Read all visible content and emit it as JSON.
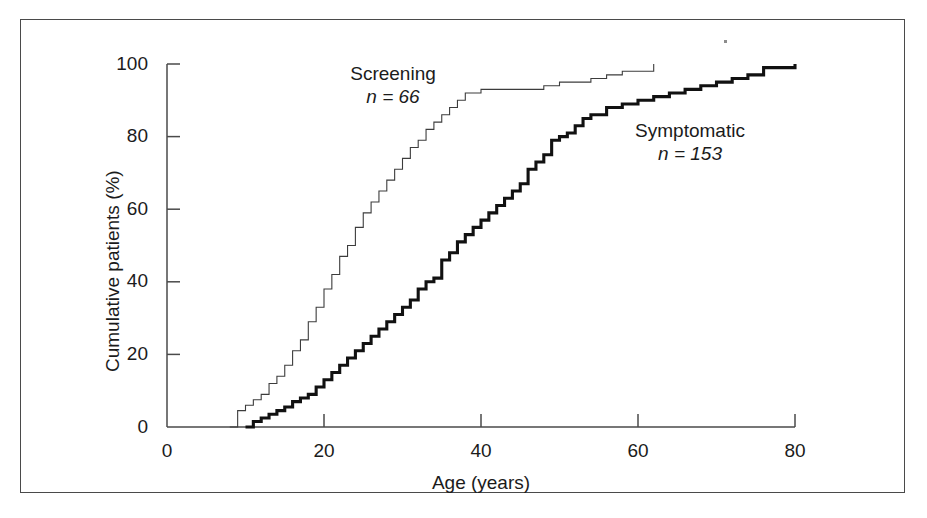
{
  "figure": {
    "background_color": "#ffffff",
    "frame_color": "#4a4a4a",
    "text_color": "#1b1b1b"
  },
  "chart_data": {
    "type": "line",
    "title": "",
    "subtitle": "",
    "xlabel": "Age (years)",
    "ylabel": "Cumulative patients (%)",
    "xlim": [
      0,
      80
    ],
    "ylim": [
      0,
      100
    ],
    "xticks": [
      0,
      20,
      40,
      60,
      80
    ],
    "yticks": [
      0,
      20,
      40,
      60,
      80,
      100
    ],
    "xtick_labels": [
      "0",
      "20",
      "40",
      "60",
      "80"
    ],
    "ytick_labels": [
      "0",
      "20",
      "40",
      "60",
      "80",
      "100"
    ],
    "grid": false,
    "legend_position": "inline-annotation",
    "step_style": "post",
    "series": [
      {
        "name": "Screening",
        "annotation_label": "Screening",
        "annotation_n": "n = 66",
        "n": 66,
        "line_color": "#3c3c3c",
        "line_width": 1.1,
        "x": [
          8,
          9,
          10,
          11,
          12,
          13,
          14,
          15,
          16,
          17,
          18,
          19,
          20,
          21,
          22,
          23,
          24,
          25,
          26,
          27,
          28,
          29,
          30,
          31,
          32,
          33,
          34,
          35,
          36,
          37,
          38,
          40,
          43,
          46,
          48,
          50,
          52,
          54,
          56,
          58,
          62
        ],
        "y": [
          0,
          4.5,
          6,
          7.5,
          9,
          12,
          14,
          17,
          21,
          24,
          29,
          33,
          38,
          42,
          47,
          50,
          55,
          59,
          62,
          65,
          68,
          71,
          74,
          77,
          79,
          82,
          84,
          86,
          88,
          90,
          92,
          93,
          93,
          93,
          94,
          95,
          95,
          96,
          97,
          98,
          100
        ]
      },
      {
        "name": "Symptomatic",
        "annotation_label": "Symptomatic",
        "annotation_n": "n = 153",
        "n": 153,
        "line_color": "#111111",
        "line_width": 3.1,
        "x": [
          10,
          11,
          12,
          13,
          14,
          15,
          16,
          17,
          18,
          19,
          20,
          21,
          22,
          23,
          24,
          25,
          26,
          27,
          28,
          29,
          30,
          31,
          32,
          33,
          34,
          35,
          36,
          37,
          38,
          39,
          40,
          41,
          42,
          43,
          44,
          45,
          46,
          47,
          48,
          49,
          50,
          51,
          52,
          53,
          54,
          56,
          58,
          60,
          62,
          64,
          66,
          68,
          70,
          72,
          74,
          76,
          80
        ],
        "y": [
          0,
          1.5,
          2.5,
          3.5,
          4.5,
          5.5,
          7,
          8,
          9,
          11,
          13,
          15,
          17,
          19,
          21,
          23,
          25,
          27,
          29,
          31,
          33,
          35,
          38,
          40,
          41,
          46,
          48,
          51,
          53,
          55,
          57,
          59,
          61,
          63,
          65,
          67,
          71,
          73,
          75,
          79,
          80,
          81,
          83,
          85,
          86,
          88,
          89,
          90,
          91,
          92,
          93,
          94,
          95,
          96,
          97,
          99,
          100
        ]
      }
    ]
  },
  "axes": {
    "x_title": "Age (years)",
    "y_title": "Cumulative patients (%)"
  },
  "annotations": [
    {
      "name": "screening",
      "label": "Screening",
      "n_text": "n = 66"
    },
    {
      "name": "symptomatic",
      "label": "Symptomatic",
      "n_text": "n = 153"
    }
  ]
}
